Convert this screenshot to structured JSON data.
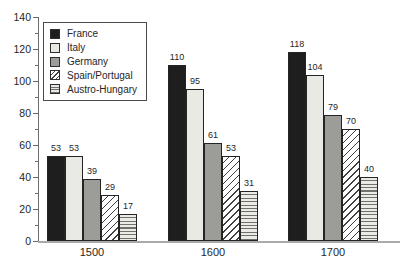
{
  "chart_data": {
    "type": "bar",
    "title": "",
    "categories": [
      "1500",
      "1600",
      "1700"
    ],
    "series": [
      {
        "name": "France",
        "values": [
          53,
          110,
          118
        ],
        "color": "#1e1e1e",
        "pattern": "solid"
      },
      {
        "name": "Italy",
        "values": [
          53,
          95,
          104
        ],
        "color": "#eaeae5",
        "pattern": "solid"
      },
      {
        "name": "Germany",
        "values": [
          39,
          61,
          79
        ],
        "color": "#9c9c98",
        "pattern": "solid"
      },
      {
        "name": "Spain/Portugal",
        "values": [
          29,
          53,
          70
        ],
        "color": "#ffffff",
        "pattern": "diagonal"
      },
      {
        "name": "Austro-Hungary",
        "values": [
          17,
          31,
          40
        ],
        "color": "#eceae6",
        "pattern": "horizontal"
      }
    ],
    "ylim": [
      0,
      140
    ],
    "ytick_labels": [
      0,
      20,
      40,
      60,
      80,
      100,
      120,
      140
    ],
    "yminor_step": 10,
    "bar_value_labels_shown": true,
    "legend_position": "top-left",
    "grid": false,
    "axis_color": "#6b6b68",
    "baseline_color": "#aaaaa6"
  }
}
